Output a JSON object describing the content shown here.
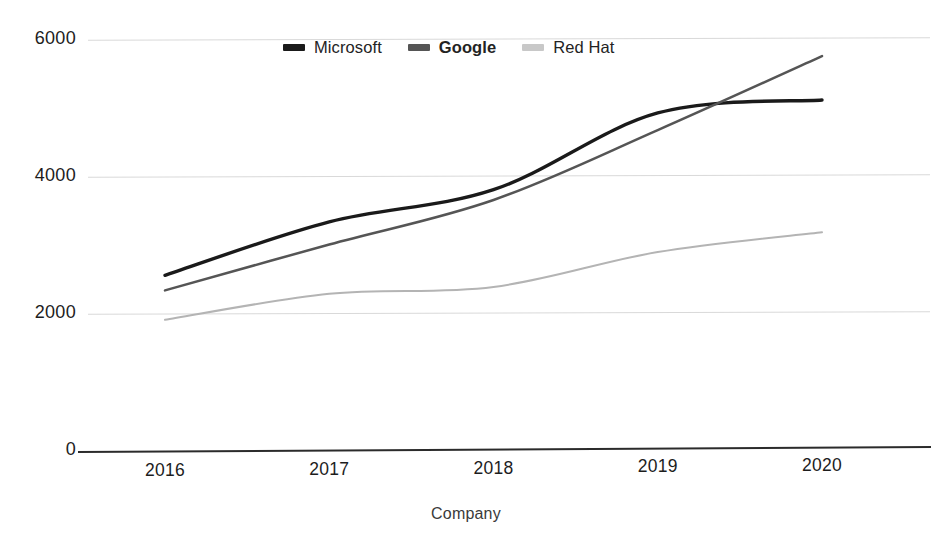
{
  "chart_data": {
    "type": "line",
    "title": "",
    "xlabel": "Company",
    "ylabel": "",
    "x": [
      "2016",
      "2017",
      "2018",
      "2019",
      "2020"
    ],
    "categories": [
      "2016",
      "2017",
      "2018",
      "2019",
      "2020"
    ],
    "series": [
      {
        "name": "Microsoft",
        "color": "#1a1a1a",
        "bold_label": false,
        "values": [
          2550,
          3330,
          3800,
          4920,
          5110
        ]
      },
      {
        "name": "Google",
        "color": "#555555",
        "bold_label": true,
        "values": [
          2330,
          3000,
          3650,
          4670,
          5750
        ]
      },
      {
        "name": "Red Hat",
        "color": "#b4b4b4",
        "bold_label": false,
        "values": [
          1900,
          2280,
          2380,
          2890,
          3180
        ]
      }
    ],
    "ylim": [
      0,
      6000
    ],
    "yticks": [
      0,
      2000,
      4000,
      6000
    ],
    "ytick_labels": [
      "0",
      "2000",
      "4000",
      "6000"
    ],
    "grid": true,
    "grid_color": "#d9d9d9",
    "legend_position": "top-center",
    "axis_color": "#2b2b2b",
    "background": "#ffffff"
  },
  "legend": {
    "items": [
      {
        "label": "Microsoft",
        "swatch": "#1a1a1a",
        "bold": false
      },
      {
        "label": "Google",
        "swatch": "#555555",
        "bold": true
      },
      {
        "label": "Red Hat",
        "swatch": "#c8c8c8",
        "bold": false
      }
    ]
  },
  "axes": {
    "x_title": "Company",
    "y_tick_labels": [
      "6000",
      "4000",
      "2000",
      "0"
    ],
    "x_tick_labels": [
      "2016",
      "2017",
      "2018",
      "2019",
      "2020"
    ]
  }
}
